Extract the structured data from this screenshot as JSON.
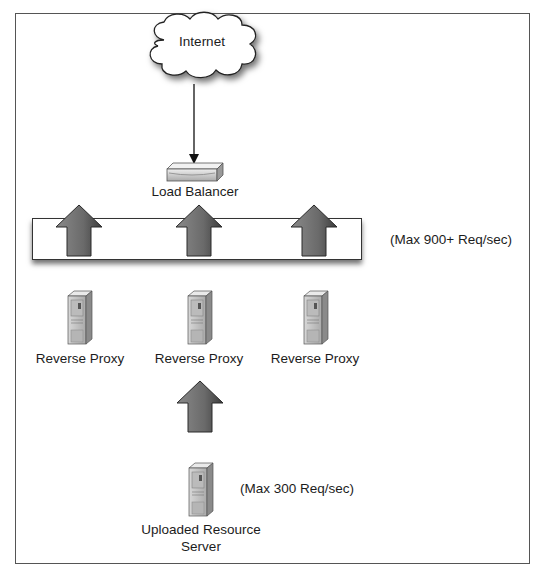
{
  "diagram": {
    "type": "network-architecture",
    "nodes": {
      "internet": {
        "label": "Internet",
        "icon": "cloud-icon"
      },
      "load_balancer": {
        "label": "Load Balancer",
        "icon": "load-balancer-icon"
      },
      "reverse_proxies": [
        {
          "label": "Reverse Proxy",
          "icon": "server-icon"
        },
        {
          "label": "Reverse Proxy",
          "icon": "server-icon"
        },
        {
          "label": "Reverse Proxy",
          "icon": "server-icon"
        }
      ],
      "origin": {
        "label_line1": "Uploaded Resource",
        "label_line2": "Server",
        "icon": "server-icon"
      }
    },
    "annotations": {
      "proxy_tier_capacity": "(Max 900+ Req/sec)",
      "origin_capacity": "(Max 300 Req/sec)"
    },
    "edges": [
      {
        "from": "Internet",
        "to": "Load Balancer",
        "style": "thin-arrow"
      },
      {
        "from": "Reverse Proxy tier",
        "to": "Load Balancer",
        "style": "block-arrow",
        "count": 3
      },
      {
        "from": "Uploaded Resource Server",
        "to": "Reverse Proxy",
        "style": "block-arrow"
      }
    ],
    "colors": {
      "arrow_fill": "#6e6e6e",
      "arrow_dark": "#3a3a3a",
      "frame": "#555555",
      "server_body": "#c8c8c8"
    }
  }
}
